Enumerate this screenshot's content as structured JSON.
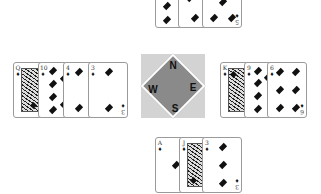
{
  "table": {
    "background": "#ffffff"
  },
  "compass": {
    "north": "N",
    "east": "E",
    "south": "S",
    "west": "W",
    "color": "#8a8a8a",
    "bg": "#d3d3d3"
  },
  "hands": {
    "north": [
      {
        "rank": "8",
        "suit": "♦"
      },
      {
        "rank": "7",
        "suit": "♦"
      },
      {
        "rank": "5",
        "suit": "♦"
      }
    ],
    "west": [
      {
        "rank": "Q",
        "suit": "♦"
      },
      {
        "rank": "10",
        "suit": "♦"
      },
      {
        "rank": "4",
        "suit": "♦"
      },
      {
        "rank": "3",
        "suit": "♦"
      }
    ],
    "east": [
      {
        "rank": "K",
        "suit": "♦"
      },
      {
        "rank": "9",
        "suit": "♦"
      },
      {
        "rank": "6",
        "suit": "♦"
      }
    ],
    "south": [
      {
        "rank": "A",
        "suit": "♦"
      },
      {
        "rank": "J",
        "suit": "♦"
      },
      {
        "rank": "3",
        "suit": "♦"
      }
    ]
  }
}
